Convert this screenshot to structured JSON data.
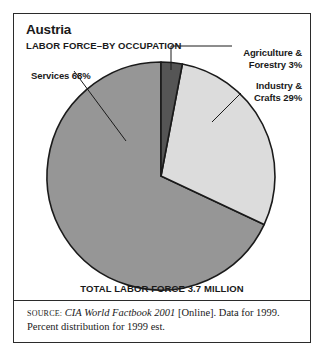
{
  "figure": {
    "title": "Austria",
    "subtitle": "LABOR FORCE–BY OCCUPATION",
    "total_line": "TOTAL LABOR FORCE 3.7 MILLION"
  },
  "labels": {
    "services": "Services 68%",
    "agriculture_l1": "Agriculture &",
    "agriculture_l2": "Forestry 3%",
    "industry_l1": "Industry &",
    "industry_l2": "Crafts 29%"
  },
  "source": {
    "label": "SOURCE:",
    "title": "CIA World Factbook 2001",
    "rest": " [Online]. Data for 1999. Percent distribution for 1999 est."
  },
  "colors": {
    "services": "#969696",
    "industry": "#dcdcdc",
    "agriculture": "#555555",
    "outline": "#1a1a1a",
    "frame": "#2b2b2b",
    "text": "#1a1a1a",
    "background": "#ffffff"
  },
  "chart_data": {
    "type": "pie",
    "subtitle": "TOTAL LABOR FORCE 3.7 MILLION",
    "unit": "percent",
    "total_labor_force_millions": 3.7,
    "categories": [
      "Agriculture & Forestry",
      "Industry & Crafts",
      "Services"
    ],
    "values": [
      3,
      29,
      68
    ],
    "slice_colors": [
      "#555555",
      "#dcdcdc",
      "#969696"
    ],
    "start_angle_deg": 0,
    "direction": "clockwise",
    "legend": "labels-with-leader-lines",
    "grid": false,
    "annotations": [
      "Agriculture & Forestry 3%",
      "Industry & Crafts 29%",
      "Services 68%"
    ]
  }
}
